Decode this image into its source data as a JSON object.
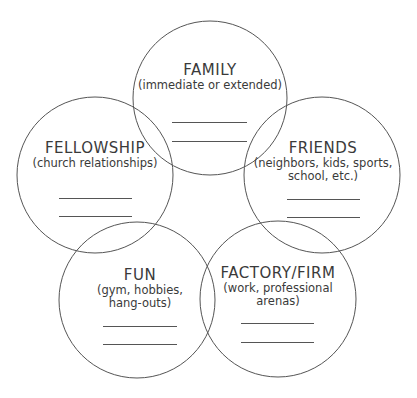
{
  "diagram": {
    "type": "overlapping-circles",
    "stroke_color": "#555555",
    "text_color": "#3a3a3a",
    "background": "#ffffff",
    "circles": [
      {
        "id": "family",
        "title": "FAMILY",
        "subtitle_lines": [
          "(immediate or extended)"
        ],
        "blank_lines": 2
      },
      {
        "id": "fellowship",
        "title": "FELLOWSHIP",
        "subtitle_lines": [
          "(church relationships)"
        ],
        "blank_lines": 2
      },
      {
        "id": "friends",
        "title": "FRIENDS",
        "subtitle_lines": [
          "(neighbors, kids, sports,",
          "school, etc.)"
        ],
        "blank_lines": 2
      },
      {
        "id": "fun",
        "title": "FUN",
        "subtitle_lines": [
          "(gym, hobbies,",
          "hang-outs)"
        ],
        "blank_lines": 2
      },
      {
        "id": "factory-firm",
        "title": "FACTORY/FIRM",
        "subtitle_lines": [
          "(work, professional",
          "arenas)"
        ],
        "blank_lines": 2
      }
    ]
  }
}
